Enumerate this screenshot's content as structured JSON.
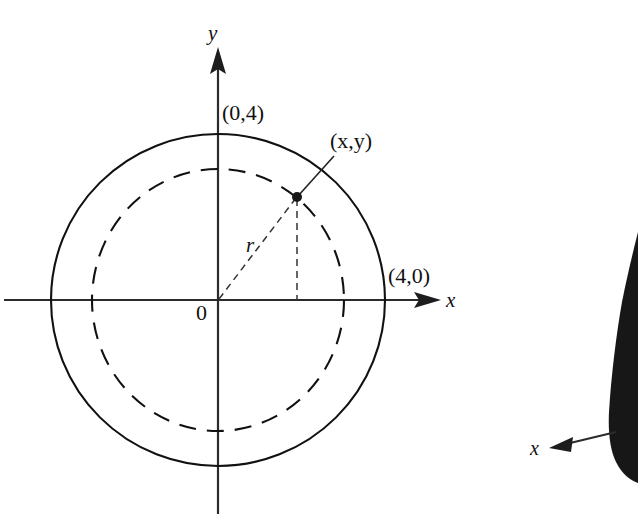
{
  "figure": {
    "type": "geometry-diagram",
    "background_color": "#ffffff",
    "ink_color": "#111111",
    "axes": {
      "x_axis_label": "x",
      "y_axis_label": "y",
      "origin_label": "0",
      "origin_px": {
        "x": 218,
        "y": 300
      },
      "x_axis_span_px": {
        "from": 4,
        "to": 440
      },
      "y_axis_span_px": {
        "from": 48,
        "to": 514
      },
      "x_arrow_direction": "right",
      "y_arrow_direction": "up"
    },
    "outer_circle": {
      "style": "solid",
      "center_px": {
        "x": 218,
        "y": 300
      },
      "radius_px": 167,
      "x_intercept_label": "(4,0)",
      "y_intercept_label": "(0,4)",
      "radius_value": 4
    },
    "inner_circle": {
      "style": "dashed",
      "center_px": {
        "x": 218,
        "y": 300
      },
      "radius_px": 128
    },
    "point": {
      "label": "(x,y)",
      "label_x": "x",
      "label_y": "y",
      "px": {
        "x": 297,
        "y": 197
      },
      "on_curve": "inner_circle",
      "marker": "filled-dot"
    },
    "radius_segment": {
      "label": "r",
      "style": "dashed",
      "from_px": {
        "x": 218,
        "y": 300
      },
      "to_px": {
        "x": 297,
        "y": 197
      },
      "label_px": {
        "x": 252,
        "y": 244
      }
    },
    "drop_line": {
      "style": "dashed",
      "description": "vertical dashed line from point down to x-axis",
      "from_px": {
        "x": 297,
        "y": 197
      },
      "to_px": {
        "x": 297,
        "y": 300
      }
    },
    "leader_line": {
      "from_px": {
        "x": 297,
        "y": 197
      },
      "to_px": {
        "x": 332,
        "y": 158
      }
    },
    "labels": {
      "y_intercept": "(0,4)",
      "x_intercept": "(4,0)",
      "point": "(x,y)",
      "radius": "r",
      "origin": "0",
      "x_axis": "x",
      "y_axis": "y"
    }
  },
  "partial_figure_right": {
    "description": "edge of an adjacent figure: dark filled region with an x-axis arrow pointing left",
    "x_axis_label": "x",
    "arrow_direction": "left",
    "arrow_from_px": {
      "x": 614,
      "y": 432
    },
    "arrow_to_px": {
      "x": 552,
      "y": 447
    },
    "label_px": {
      "x": 536,
      "y": 450
    },
    "fill_color": "#171717"
  }
}
